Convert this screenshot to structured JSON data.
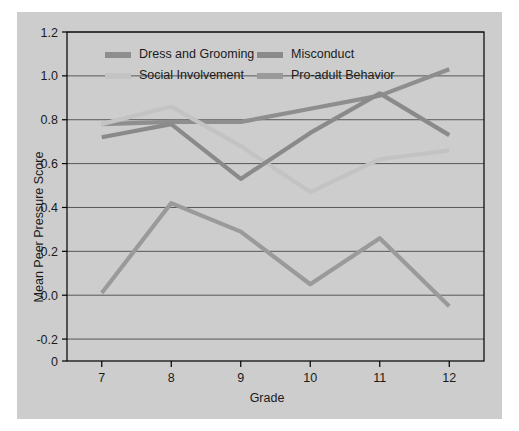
{
  "chart_data": {
    "type": "line",
    "title": "",
    "xlabel": "Grade",
    "ylabel": "Mean Peer Pressure Score",
    "categories": [
      "7",
      "8",
      "9",
      "10",
      "11",
      "12"
    ],
    "x": [
      7,
      8,
      9,
      10,
      11,
      12
    ],
    "xlim": [
      6.5,
      12.5
    ],
    "ylim": [
      -0.3,
      1.2
    ],
    "yticks": [
      "1.2",
      "1.0",
      "0.8",
      "0.6",
      "0.4",
      "0.2",
      "0.0",
      "-0.2",
      "0"
    ],
    "ytick_values": [
      1.2,
      1.0,
      0.8,
      0.6,
      0.4,
      0.2,
      0.0,
      -0.2,
      -0.3
    ],
    "xticks": [
      "7",
      "8",
      "9",
      "10",
      "11",
      "12"
    ],
    "grid": "horizontal",
    "legend_position": "top-inside",
    "series": [
      {
        "name": "Dress and Grooming",
        "color": "#8e8e8e",
        "values": [
          0.78,
          0.79,
          0.79,
          0.85,
          0.91,
          1.03
        ]
      },
      {
        "name": "Social Involvement",
        "color": "#c3c3c3",
        "values": [
          0.78,
          0.86,
          0.68,
          0.47,
          0.62,
          0.66
        ]
      },
      {
        "name": "Misconduct",
        "color": "#8a8a8a",
        "values": [
          0.72,
          0.78,
          0.53,
          0.74,
          0.92,
          0.73
        ]
      },
      {
        "name": "Pro-adult Behavior",
        "color": "#9a9a9a",
        "values": [
          0.01,
          0.42,
          0.29,
          0.05,
          0.26,
          -0.05
        ]
      }
    ]
  },
  "colors": {
    "figure_background": "#cdcdcd",
    "page_background": "#ffffff",
    "axis": "#000000",
    "gridline": "#4a4a4a",
    "text": "#1b1b1b"
  }
}
